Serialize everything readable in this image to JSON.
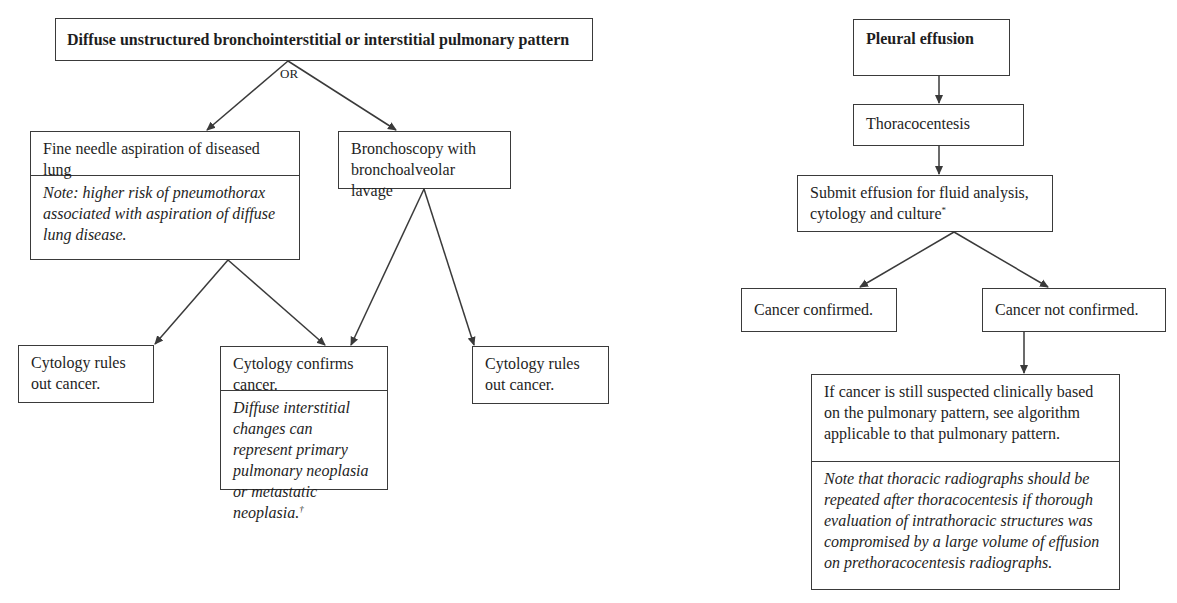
{
  "left_flow": {
    "root": "Diffuse unstructured bronchointerstitial or interstitial pulmonary pattern",
    "branch_label": "OR",
    "fna": {
      "title": "Fine needle aspiration of diseased lung",
      "note": "Note: higher risk of pneumothorax associated with aspiration of diffuse lung disease."
    },
    "bronchoscopy": {
      "title": "Bronchoscopy with bronchoalveolar lavage"
    },
    "cytology_rules_out_left": "Cytology rules out cancer.",
    "cytology_confirms": {
      "title": "Cytology confirms cancer.",
      "note": "Diffuse interstitial changes can represent primary pulmonary neoplasia or metastatic neoplasia.",
      "footnote_mark": "†"
    },
    "cytology_rules_out_right": "Cytology rules out cancer."
  },
  "right_flow": {
    "root": "Pleural effusion",
    "step1": "Thoracocentesis",
    "step2": "Submit effusion for fluid analysis, cytology and culture",
    "step2_footnote_mark": "*",
    "outcome_confirmed": "Cancer confirmed.",
    "outcome_not_confirmed": "Cancer not confirmed.",
    "followup": {
      "title": "If cancer is still suspected clinically based on the pulmonary pattern, see algorithm applicable to that pulmonary pattern.",
      "note": "Note that thoracic radiographs should be repeated after thoracocentesis if thorough evaluation of intrathoracic structures was compromised by a large volume of effusion on prethoracocentesis radiographs."
    }
  },
  "colors": {
    "line": "#3a3a3a",
    "text": "#1e1e1e",
    "background": "#ffffff"
  }
}
